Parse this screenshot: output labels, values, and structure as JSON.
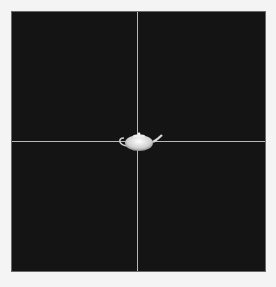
{
  "viewport": {
    "background": "#141414",
    "crosshair_color": "#b8b8b8",
    "object": "teapot"
  }
}
